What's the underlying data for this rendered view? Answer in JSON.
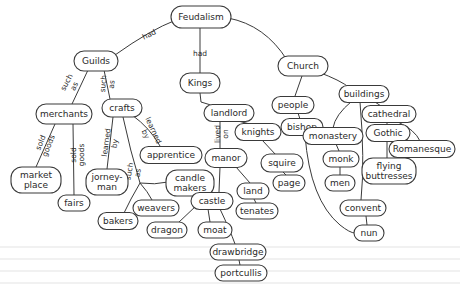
{
  "diagram": {
    "title": "Feudalism",
    "type": "concept-map",
    "colors": {
      "stroke": "#3a3a3a",
      "text": "#2a2a2a",
      "background": "#ffffff"
    },
    "nodes": [
      {
        "id": "feudalism",
        "label": "Feudalism",
        "x": 201,
        "y": 17,
        "w": 60,
        "h": 22
      },
      {
        "id": "guilds",
        "label": "Guilds",
        "x": 96,
        "y": 61,
        "w": 44,
        "h": 20
      },
      {
        "id": "kings",
        "label": "Kings",
        "x": 200,
        "y": 83,
        "w": 40,
        "h": 20
      },
      {
        "id": "church",
        "label": "Church",
        "x": 303,
        "y": 66,
        "w": 50,
        "h": 20
      },
      {
        "id": "merchants",
        "label": "merchants",
        "x": 64,
        "y": 114,
        "w": 56,
        "h": 20
      },
      {
        "id": "crafts",
        "label": "crafts",
        "x": 122,
        "y": 108,
        "w": 40,
        "h": 18
      },
      {
        "id": "landlord",
        "label": "landlord",
        "x": 229,
        "y": 113,
        "w": 50,
        "h": 17
      },
      {
        "id": "people",
        "label": "people",
        "x": 293,
        "y": 105,
        "w": 42,
        "h": 17
      },
      {
        "id": "buildings",
        "label": "buildings",
        "x": 364,
        "y": 94,
        "w": 50,
        "h": 17
      },
      {
        "id": "cathedral",
        "label": "cathedral",
        "x": 389,
        "y": 114,
        "w": 54,
        "h": 17
      },
      {
        "id": "bishop",
        "label": "bishop",
        "x": 302,
        "y": 127,
        "w": 42,
        "h": 17
      },
      {
        "id": "knights",
        "label": "knights",
        "x": 258,
        "y": 132,
        "w": 46,
        "h": 17
      },
      {
        "id": "apprentice",
        "label": "apprentice",
        "x": 171,
        "y": 155,
        "w": 62,
        "h": 17
      },
      {
        "id": "monastery",
        "label": "monastery",
        "x": 333,
        "y": 136,
        "w": 60,
        "h": 17
      },
      {
        "id": "gothic",
        "label": "Gothic",
        "x": 388,
        "y": 133,
        "w": 44,
        "h": 17
      },
      {
        "id": "romanesque",
        "label": "Romanesque",
        "x": 422,
        "y": 149,
        "w": 66,
        "h": 17
      },
      {
        "id": "manor",
        "label": "manor",
        "x": 226,
        "y": 158,
        "w": 42,
        "h": 19
      },
      {
        "id": "squire",
        "label": "squire",
        "x": 282,
        "y": 163,
        "w": 42,
        "h": 18
      },
      {
        "id": "monk",
        "label": "monk",
        "x": 341,
        "y": 159,
        "w": 36,
        "h": 16
      },
      {
        "id": "flying_buttresses",
        "label": "flying\nbuttresses",
        "x": 389,
        "y": 171,
        "w": 54,
        "h": 26
      },
      {
        "id": "market_place",
        "label": "market\nplace",
        "x": 36,
        "y": 180,
        "w": 50,
        "h": 26
      },
      {
        "id": "jorneyman",
        "label": "jorney-\nman",
        "x": 107,
        "y": 182,
        "w": 42,
        "h": 26
      },
      {
        "id": "candle_makers",
        "label": "candle\nmakers",
        "x": 190,
        "y": 183,
        "w": 48,
        "h": 26
      },
      {
        "id": "men",
        "label": "men",
        "x": 340,
        "y": 183,
        "w": 30,
        "h": 16
      },
      {
        "id": "page",
        "label": "page",
        "x": 289,
        "y": 183,
        "w": 32,
        "h": 16
      },
      {
        "id": "land",
        "label": "land",
        "x": 253,
        "y": 191,
        "w": 32,
        "h": 16
      },
      {
        "id": "castle",
        "label": "castle",
        "x": 212,
        "y": 201,
        "w": 42,
        "h": 17
      },
      {
        "id": "weavers",
        "label": "weavers",
        "x": 156,
        "y": 208,
        "w": 46,
        "h": 16
      },
      {
        "id": "fairs",
        "label": "fairs",
        "x": 74,
        "y": 203,
        "w": 32,
        "h": 16
      },
      {
        "id": "tenates",
        "label": "tenates",
        "x": 257,
        "y": 211,
        "w": 42,
        "h": 16
      },
      {
        "id": "convent",
        "label": "convent",
        "x": 363,
        "y": 208,
        "w": 46,
        "h": 16
      },
      {
        "id": "bakers",
        "label": "bakers",
        "x": 118,
        "y": 221,
        "w": 40,
        "h": 17
      },
      {
        "id": "dragon",
        "label": "dragon",
        "x": 167,
        "y": 230,
        "w": 40,
        "h": 16
      },
      {
        "id": "moat",
        "label": "moat",
        "x": 215,
        "y": 230,
        "w": 34,
        "h": 16
      },
      {
        "id": "nun",
        "label": "nun",
        "x": 369,
        "y": 233,
        "w": 30,
        "h": 16
      },
      {
        "id": "drawbridge",
        "label": "drawbridge",
        "x": 238,
        "y": 252,
        "w": 56,
        "h": 16
      },
      {
        "id": "portcullis",
        "label": "portcullis",
        "x": 241,
        "y": 273,
        "w": 52,
        "h": 16
      }
    ],
    "edges": [
      {
        "from": "feudalism",
        "to": "guilds",
        "label": "had",
        "path": "M176,20 Q150,30 115,55",
        "lx": 149,
        "ly": 34,
        "rot": -25
      },
      {
        "from": "feudalism",
        "to": "kings",
        "label": "had",
        "path": "M200,28 L200,73",
        "lx": 200,
        "ly": 53,
        "rot": 0
      },
      {
        "from": "feudalism",
        "to": "church",
        "label": "",
        "path": "M228,18 Q265,25 287,60",
        "lx": 0,
        "ly": 0,
        "rot": 0
      },
      {
        "from": "guilds",
        "to": "merchants",
        "label": "such\nas",
        "path": "M88,70 L72,104",
        "lx": 70,
        "ly": 84,
        "rot": -62
      },
      {
        "from": "guilds",
        "to": "crafts",
        "label": "such\nas",
        "path": "M104,70 L110,99",
        "lx": 107,
        "ly": 84,
        "rot": -85
      },
      {
        "from": "kings",
        "to": "landlord",
        "label": "",
        "path": "M200,93 L201,102 Q210,106 222,106",
        "lx": 0,
        "ly": 0,
        "rot": 0
      },
      {
        "from": "church",
        "to": "people",
        "label": "",
        "path": "M302,76 L295,96",
        "lx": 0,
        "ly": 0,
        "rot": 0
      },
      {
        "from": "church",
        "to": "buildings",
        "label": "",
        "path": "M318,72 Q340,80 350,88",
        "lx": 0,
        "ly": 0,
        "rot": 0
      },
      {
        "from": "merchants",
        "to": "market_place",
        "label": "sold\ngoods",
        "path": "M55,124 L36,167",
        "lx": 44,
        "ly": 144,
        "rot": -68
      },
      {
        "from": "merchants",
        "to": "fairs",
        "label": "sold\ngoods",
        "path": "M73,124 L74,195",
        "lx": 77,
        "ly": 155,
        "rot": -90
      },
      {
        "from": "crafts",
        "to": "jorneyman",
        "label": "learned\nby",
        "path": "M113,117 L107,169",
        "lx": 110,
        "ly": 143,
        "rot": -82
      },
      {
        "from": "crafts",
        "to": "apprentice",
        "label": "learned\nby",
        "path": "M132,115 Q150,128 160,146",
        "lx": 150,
        "ly": 132,
        "rot": 65
      },
      {
        "from": "crafts",
        "to": "crafts_split",
        "label": "such\nas",
        "path": "M123,117 Q130,150 140,183",
        "lx": 133,
        "ly": 172,
        "rot": -80
      },
      {
        "from": "crafts_split",
        "to": "candle_makers",
        "label": "",
        "path": "M140,183 Q155,185 168,182",
        "lx": 0,
        "ly": 0,
        "rot": 0
      },
      {
        "from": "crafts_split",
        "to": "weavers",
        "label": "",
        "path": "M140,183 Q148,192 152,200",
        "lx": 0,
        "ly": 0,
        "rot": 0
      },
      {
        "from": "crafts_split",
        "to": "bakers",
        "label": "",
        "path": "M140,183 Q130,200 124,213",
        "lx": 0,
        "ly": 0,
        "rot": 0
      },
      {
        "from": "landlord",
        "to": "manor",
        "label": "lived\non",
        "path": "M220,121 L220,149",
        "lx": 221,
        "ly": 134,
        "rot": -90
      },
      {
        "from": "landlord",
        "to": "knights",
        "label": "",
        "path": "M238,121 L250,124",
        "lx": 0,
        "ly": 0,
        "rot": 0
      },
      {
        "from": "knights",
        "to": "squire",
        "label": "",
        "path": "M262,140 L276,155",
        "lx": 0,
        "ly": 0,
        "rot": 0
      },
      {
        "from": "squire",
        "to": "page",
        "label": "",
        "path": "M283,172 L286,175",
        "lx": 0,
        "ly": 0,
        "rot": 0
      },
      {
        "from": "manor",
        "to": "land",
        "label": "",
        "path": "M236,167 L250,183",
        "lx": 0,
        "ly": 0,
        "rot": 0
      },
      {
        "from": "land",
        "to": "tenates",
        "label": "",
        "path": "M254,199 L256,203",
        "lx": 0,
        "ly": 0,
        "rot": 0
      },
      {
        "from": "manor",
        "to": "castle",
        "label": "",
        "path": "M220,167 L219,192",
        "lx": 0,
        "ly": 0,
        "rot": 0
      },
      {
        "from": "castle",
        "to": "dragon",
        "label": "",
        "path": "M197,205 L178,223",
        "lx": 0,
        "ly": 0,
        "rot": 0
      },
      {
        "from": "castle",
        "to": "moat",
        "label": "",
        "path": "M208,209 L210,222",
        "lx": 0,
        "ly": 0,
        "rot": 0
      },
      {
        "from": "castle",
        "to": "drawbridge",
        "label": "",
        "path": "M220,209 Q230,230 235,244",
        "lx": 0,
        "ly": 0,
        "rot": 0
      },
      {
        "from": "drawbridge",
        "to": "portcullis",
        "label": "",
        "path": "M239,260 L240,265",
        "lx": 0,
        "ly": 0,
        "rot": 0
      },
      {
        "from": "people",
        "to": "bishop",
        "label": "",
        "path": "M298,113 L300,119",
        "lx": 0,
        "ly": 0,
        "rot": 0
      },
      {
        "from": "buildings",
        "to": "cathedral",
        "label": "",
        "path": "M375,102 L381,106",
        "lx": 0,
        "ly": 0,
        "rot": 0
      },
      {
        "from": "buildings",
        "to": "monastery",
        "label": "",
        "path": "M352,101 Q335,115 333,128",
        "lx": 0,
        "ly": 0,
        "rot": 0
      },
      {
        "from": "buildings",
        "to": "convent",
        "label": "",
        "path": "M360,102 Q365,160 361,200",
        "lx": 0,
        "ly": 0,
        "rot": 0
      },
      {
        "from": "bishop",
        "to": "nun",
        "label": "",
        "path": "M305,135 Q310,200 340,225 Q350,233 355,233",
        "lx": 0,
        "ly": 0,
        "rot": 0
      },
      {
        "from": "cathedral",
        "to": "gothic",
        "label": "",
        "path": "M387,122 L387,125",
        "lx": 0,
        "ly": 0,
        "rot": 0
      },
      {
        "from": "cathedral",
        "to": "romanesque",
        "label": "",
        "path": "M398,122 Q415,130 420,141",
        "lx": 0,
        "ly": 0,
        "rot": 0
      },
      {
        "from": "gothic",
        "to": "flying_buttresses",
        "label": "",
        "path": "M387,141 L387,158",
        "lx": 0,
        "ly": 0,
        "rot": 0
      },
      {
        "from": "monastery",
        "to": "monk",
        "label": "",
        "path": "M336,144 L339,151",
        "lx": 0,
        "ly": 0,
        "rot": 0
      },
      {
        "from": "monk",
        "to": "men",
        "label": "",
        "path": "M340,167 L340,175",
        "lx": 0,
        "ly": 0,
        "rot": 0
      },
      {
        "from": "convent",
        "to": "nun",
        "label": "",
        "path": "M366,216 L367,225",
        "lx": 0,
        "ly": 0,
        "rot": 0
      }
    ]
  }
}
